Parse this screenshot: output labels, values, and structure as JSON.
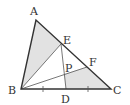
{
  "diagram": {
    "type": "geometry-triangle",
    "colors": {
      "background": "#ffffff",
      "line": "#333333",
      "thin_line": "#555555",
      "shade": "#e2e2e2"
    },
    "points": {
      "A": {
        "label": "A",
        "x": 36,
        "y": 20
      },
      "B": {
        "label": "B",
        "x": 21,
        "y": 89
      },
      "C": {
        "label": "C",
        "x": 111,
        "y": 89
      },
      "D": {
        "label": "D",
        "x": 66,
        "y": 89
      },
      "E": {
        "label": "E",
        "x": 61,
        "y": 44
      },
      "F": {
        "label": "F",
        "x": 87,
        "y": 67
      },
      "P": {
        "label": "P",
        "x": 64,
        "y": 74
      }
    },
    "labels": {
      "A": "A",
      "B": "B",
      "C": "C",
      "D": "D",
      "E": "E",
      "F": "F",
      "P": "P"
    },
    "segments": [
      "AB",
      "BC",
      "CA",
      "BE",
      "BF",
      "ED"
    ],
    "shaded_regions": [
      "ABE",
      "PDCF"
    ],
    "equal_marks": [
      "BD",
      "DC"
    ]
  }
}
